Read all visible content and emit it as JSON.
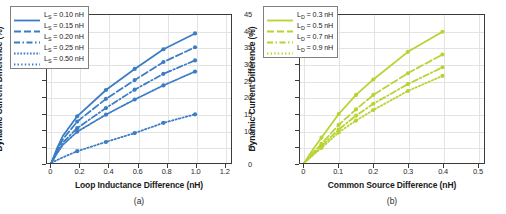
{
  "figure": {
    "panels": [
      {
        "id": "a",
        "caption": "(a)",
        "color": "#3b7dc4",
        "legend_title_symbol": "L",
        "legend_title_sub": "S"
      },
      {
        "id": "b",
        "caption": "(b)",
        "color": "#b7d431",
        "legend_title_symbol": "L",
        "legend_title_sub": "D"
      }
    ]
  },
  "chart_data": [
    {
      "type": "line",
      "panel": "a",
      "title": "",
      "xlabel": "Loop Inductance Difference (nH)",
      "ylabel": "Dynamic Current Difference (%)",
      "xlim": [
        -0.03,
        1.25
      ],
      "ylim": [
        0,
        45
      ],
      "xticks": [
        "0",
        "0.2",
        "0.4",
        "0.6",
        "0.8",
        "1.0",
        "1.2"
      ],
      "xtick_values": [
        0,
        0.2,
        0.4,
        0.6,
        0.8,
        1.0,
        1.2
      ],
      "yticks": [
        "0",
        "5",
        "10",
        "15",
        "20",
        "25",
        "30",
        "35",
        "40",
        "45"
      ],
      "ytick_values": [
        0,
        5,
        10,
        15,
        20,
        25,
        30,
        35,
        40,
        45
      ],
      "grid": true,
      "legend_position": "upper-left",
      "color": "#3b7dc4",
      "x": [
        0,
        0.04,
        0.08,
        0.18,
        0.38,
        0.58,
        0.78,
        1.0
      ],
      "series": [
        {
          "name": "L_S = 0.10 nH",
          "label": "L",
          "sub": "S",
          "rest": " = 0.10 nH",
          "dash": "solid",
          "values": [
            0,
            4.5,
            8.2,
            14.2,
            22.2,
            28.6,
            34.6,
            39.4
          ]
        },
        {
          "name": "L_S = 0.15 nH",
          "label": "L",
          "sub": "S",
          "rest": " = 0.15 nH",
          "dash": "dash-long",
          "values": [
            0,
            3.9,
            7.2,
            12.6,
            19.5,
            25.2,
            30.7,
            35.2
          ]
        },
        {
          "name": "L_S = 0.20 nH",
          "label": "L",
          "sub": "S",
          "rest": " = 0.20 nH",
          "dash": "dash-dot",
          "values": [
            0,
            3.3,
            6.2,
            10.6,
            16.7,
            22.3,
            27.1,
            31.2
          ]
        },
        {
          "name": "L_S = 0.25 nH",
          "label": "L",
          "sub": "S",
          "rest": " = 0.25 nH",
          "dash": "dense-dot",
          "values": [
            0,
            2.9,
            5.5,
            9.5,
            14.7,
            19.3,
            23.6,
            27.8
          ]
        },
        {
          "name": "L_S = 0.50 nH",
          "label": "L",
          "sub": "S",
          "rest": " = 0.50 nH",
          "dash": "dot",
          "values": [
            0,
            0.9,
            1.7,
            3.6,
            6.4,
            9.1,
            12.2,
            14.8
          ]
        }
      ]
    },
    {
      "type": "line",
      "panel": "b",
      "title": "",
      "xlabel": "Common Source Difference (nH)",
      "ylabel": "Dynamic Current Difference (%)",
      "xlim": [
        -0.012,
        0.52
      ],
      "ylim": [
        0,
        45
      ],
      "xticks": [
        "0",
        "0.1",
        "0.2",
        "0.3",
        "0.4",
        "0.5"
      ],
      "xtick_values": [
        0,
        0.1,
        0.2,
        0.3,
        0.4,
        0.5
      ],
      "yticks": [
        "0",
        "5",
        "10",
        "15",
        "20",
        "25",
        "30",
        "35",
        "40",
        "45"
      ],
      "ytick_values": [
        0,
        5,
        10,
        15,
        20,
        25,
        30,
        35,
        40,
        45
      ],
      "grid": true,
      "legend_position": "upper-left",
      "color": "#b7d431",
      "x": [
        0,
        0.01,
        0.025,
        0.05,
        0.1,
        0.15,
        0.2,
        0.3,
        0.4
      ],
      "series": [
        {
          "name": "L_D = 0.3 nH",
          "label": "L",
          "sub": "D",
          "rest": " = 0.3 nH",
          "dash": "solid",
          "values": [
            0,
            1.6,
            4.0,
            7.7,
            14.9,
            20.7,
            25.4,
            33.8,
            39.9
          ]
        },
        {
          "name": "L_D = 0.5 nH",
          "label": "L",
          "sub": "D",
          "rest": " = 0.5 nH",
          "dash": "dash-long",
          "values": [
            0,
            1.2,
            3.0,
            5.8,
            11.6,
            16.3,
            20.7,
            27.3,
            33.0
          ]
        },
        {
          "name": "L_D = 0.7 nH",
          "label": "L",
          "sub": "D",
          "rest": " = 0.7 nH",
          "dash": "dash-dot",
          "values": [
            0,
            1.0,
            2.6,
            5.1,
            10.2,
            14.4,
            18.0,
            24.0,
            29.1
          ]
        },
        {
          "name": "L_D = 0.9 nH",
          "label": "L",
          "sub": "D",
          "rest": " = 0.9 nH",
          "dash": "dot",
          "values": [
            0,
            0.9,
            2.3,
            4.6,
            9.3,
            12.9,
            16.1,
            21.9,
            26.5
          ]
        }
      ]
    }
  ]
}
